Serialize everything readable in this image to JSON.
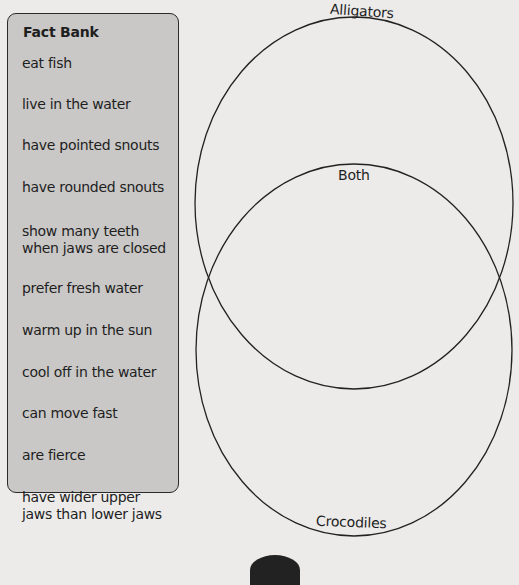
{
  "fact_bank": {
    "title": "Fact Bank",
    "items": [
      {
        "label": "eat fish",
        "top": 58
      },
      {
        "label": "live in the water",
        "top": 99
      },
      {
        "label": "have pointed snouts",
        "top": 140
      },
      {
        "label": "have rounded snouts",
        "top": 182
      },
      {
        "label": "show many teeth\nwhen jaws are closed",
        "top": 226
      },
      {
        "label": "prefer fresh water",
        "top": 283
      },
      {
        "label": "warm up in the sun",
        "top": 325
      },
      {
        "label": "cool off in the water",
        "top": 367
      },
      {
        "label": "can move fast",
        "top": 408
      },
      {
        "label": "are fierce",
        "top": 450
      },
      {
        "label": "have wider upper\njaws than lower jaws",
        "top": 492
      }
    ]
  },
  "venn": {
    "circles": [
      {
        "name": "Alligators",
        "cx": 354,
        "cy": 203,
        "rx": 159,
        "ry": 186
      },
      {
        "name": "Crocodiles",
        "cx": 354,
        "cy": 350,
        "rx": 158,
        "ry": 186
      }
    ],
    "labels": {
      "top": "Alligators",
      "middle": "Both",
      "bottom": "Crocodiles"
    }
  }
}
